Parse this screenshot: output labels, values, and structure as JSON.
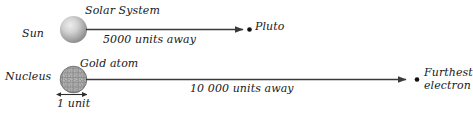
{
  "figure": {
    "background_color": "#ffffff",
    "ink_color": "#333333",
    "text_color": "#191919",
    "sphere_color_light": "#e2e2e2",
    "sphere_color_dark": "#8d8d8d",
    "nucleus_color": "#9a9a9a"
  },
  "solar_system": {
    "title": "Solar System",
    "left_body_label": "Sun",
    "right_body_label": "Pluto",
    "distance_label": "5000 units away",
    "left_body_icon": "shaded-sphere-icon",
    "right_body_icon": "dot-icon",
    "arrow_icon": "right-arrow-icon"
  },
  "gold_atom": {
    "title": "Gold atom",
    "left_body_label": "Nucleus",
    "right_body_label_line1": "Furthest",
    "right_body_label_line2": "electron",
    "distance_label": "10 000 units away",
    "size_label": "1 unit",
    "left_body_icon": "nucleus-cluster-icon",
    "right_body_icon": "dot-icon",
    "arrow_icon": "right-arrow-icon",
    "measure_icon": "double-headed-arrow-icon"
  }
}
